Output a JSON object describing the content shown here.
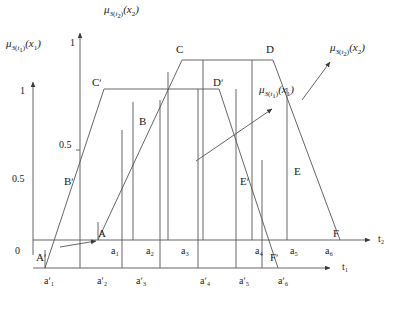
{
  "figure": {
    "type": "diagram",
    "colors": {
      "stroke": "#555555",
      "text": "#1a1a1a",
      "background": "#ffffff"
    }
  },
  "axis_labels": {
    "mu1_html": "μ<sub>З(<i>t</i><sub>1</sub>)</sub>(<i>x</i><sub>1</sub>)",
    "mu2_html": "μ<sub>З(<i>t</i><sub>2</sub>)</sub>(<i>x</i><sub>2</sub>)",
    "mu3_html": "μ<sub>З(<i>t</i><sub>2</sub>)</sub>(<i>x</i><sub>2</sub>)",
    "mu4_html": "μ<sub>З(<i>t</i><sub>1</sub>)</sub>(<i>x</i><sub>1</sub>)",
    "t1": "t₁",
    "t2": "t₂"
  },
  "y_axis_left": {
    "name": "mu-A-t1-axis",
    "ticks": [
      "1",
      "0.5",
      "0"
    ]
  },
  "y_axis_center": {
    "name": "mu-A-t2-axis",
    "ticks": [
      "1",
      "0.5"
    ]
  },
  "points_outer": [
    {
      "id": "A",
      "label": "A"
    },
    {
      "id": "B",
      "label": "B"
    },
    {
      "id": "C",
      "label": "C"
    },
    {
      "id": "D",
      "label": "D"
    },
    {
      "id": "E",
      "label": "E"
    },
    {
      "id": "F",
      "label": "F"
    }
  ],
  "points_inner": [
    {
      "id": "Ap",
      "label": "Aʹ"
    },
    {
      "id": "Bp",
      "label": "Bʹ"
    },
    {
      "id": "Cp",
      "label": "Cʹ"
    },
    {
      "id": "Dp",
      "label": "Dʹ"
    },
    {
      "id": "Ep",
      "label": "Eʹ"
    },
    {
      "id": "Fp",
      "label": "Fʹ"
    }
  ],
  "intervals_upper": [
    "a₁",
    "a₂",
    "a₃",
    "a₄",
    "a₅",
    "a₆"
  ],
  "intervals_lower": [
    "aʹ₁",
    "aʹ₂",
    "aʹ₃",
    "aʹ₄",
    "aʹ₅",
    "aʹ₆"
  ],
  "chart_data": {
    "type": "line",
    "title": "",
    "xlabel": "t₁ / t₂",
    "ylabel": "μ",
    "series": [
      {
        "name": "outer-trapezoid-ABCDEF",
        "points": [
          {
            "label": "A",
            "x": 98,
            "y": 0.0
          },
          {
            "label": "B",
            "x": 148,
            "y": 0.5
          },
          {
            "label": "C",
            "x": 182,
            "y": 1.0
          },
          {
            "label": "D",
            "x": 273,
            "y": 1.0
          },
          {
            "label": "E",
            "x": 305,
            "y": 0.5
          },
          {
            "label": "F",
            "x": 340,
            "y": 0.0
          }
        ]
      },
      {
        "name": "inner-trapezoid-ApBpCpDpEpFp",
        "points": [
          {
            "label": "Aʹ",
            "x": 45,
            "y": 0.0
          },
          {
            "label": "Bʹ",
            "x": 72,
            "y": 0.5
          },
          {
            "label": "Cʹ",
            "x": 104,
            "y": 0.83
          },
          {
            "label": "Dʹ",
            "x": 219,
            "y": 0.83
          },
          {
            "label": "Eʹ",
            "x": 243,
            "y": 0.5
          },
          {
            "label": "Fʹ",
            "x": 278,
            "y": 0.0
          }
        ]
      }
    ],
    "grid": false,
    "legend": "none"
  }
}
